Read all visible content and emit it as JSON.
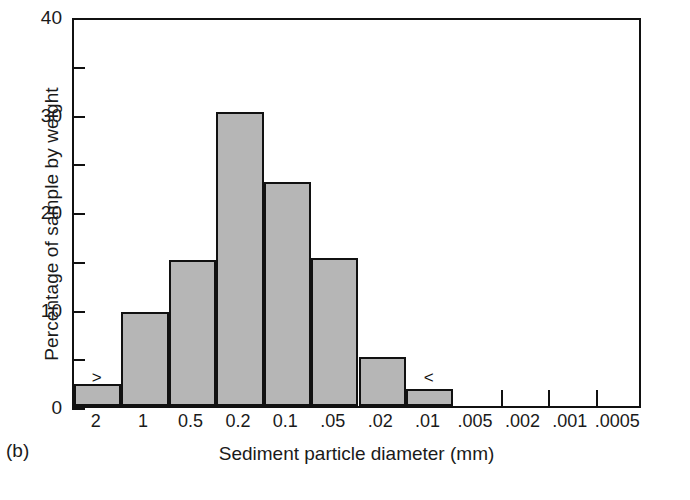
{
  "figure": {
    "panel_label": "(b)"
  },
  "chart_data": {
    "type": "bar",
    "title": "",
    "subtitle": "",
    "xlabel": "Sediment particle diameter (mm)",
    "ylabel": "Percentage of sample by weight",
    "categories": [
      "2",
      "1",
      "0.5",
      "0.2",
      "0.1",
      ".05",
      ".02",
      ".01",
      ".005",
      ".002",
      ".001",
      ".0005"
    ],
    "values": [
      2.3,
      9.6,
      15.0,
      30.2,
      23.0,
      15.2,
      5.0,
      1.7,
      0,
      0,
      0,
      0
    ],
    "ylim": [
      0,
      40
    ],
    "y_major_ticks": [
      0,
      10,
      20,
      30,
      40
    ],
    "y_minor_ticks": [
      5,
      15,
      25,
      35
    ],
    "y_tick_labels": [
      "0",
      "10",
      "20",
      "30",
      "40"
    ],
    "grid": false,
    "legend": "none",
    "bar_color": "#b6b6b6",
    "bar_edge_color": "#111111",
    "axis_color": "#111111",
    "annotations": [
      {
        "text": ">",
        "bin": 0,
        "value": 4.2
      },
      {
        "text": "<",
        "bin": 7,
        "value": 4.2
      }
    ]
  }
}
